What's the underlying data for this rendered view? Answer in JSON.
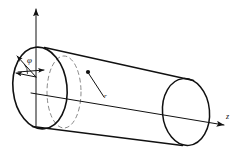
{
  "figure": {
    "type": "technical-diagram",
    "background_color": "#ffffff",
    "stroke_color": "#111111"
  },
  "labels": {
    "vertical_axis": "",
    "azimuthal_angle": "φ",
    "axial_axis": "z",
    "radial_point": "r"
  },
  "geometry": {
    "cylinder": {
      "left_face_center_x": 40,
      "left_face_center_y": 88,
      "left_face_rx": 27,
      "left_face_ry": 41,
      "right_face_center_x": 186,
      "right_face_center_y": 112,
      "right_face_rx": 23,
      "right_face_ry": 33,
      "top_edge": "from (45,47) to (193,80)",
      "bottom_edge": "from (33,126) to (182,146)"
    },
    "dashed_cross_section": {
      "center_x": 64,
      "center_y": 92,
      "rx": 17,
      "ry": 36
    },
    "vertical_axis_arrow": {
      "x": 36,
      "y_top": 6,
      "y_bottom": 126
    },
    "z_axis_arrow": {
      "x_start": 31,
      "y_start": 93,
      "x_end": 228,
      "y_end": 126
    },
    "point_marker": {
      "x": 88,
      "y": 72
    },
    "radial_line": "from (88,72) to (104,97)"
  },
  "icons": {
    "arrowhead": "triangle-arrowhead"
  }
}
